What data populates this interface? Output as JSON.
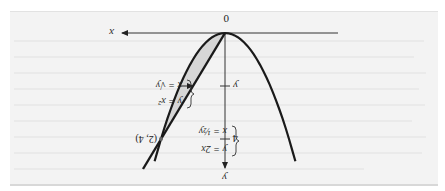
{
  "figure": {
    "orientation": "rotated 180 degrees",
    "axes": {
      "x_label": "x",
      "y_label": "y",
      "origin_label": "0",
      "y_ticks": [
        {
          "label": "y",
          "math_y": 2
        },
        {
          "label": "4",
          "math_y": 4
        }
      ]
    },
    "curves": [
      {
        "name": "parabola",
        "equation": "y = x²",
        "inverse": "x = √y"
      },
      {
        "name": "line",
        "equation": "y = 2x",
        "inverse": "x = ½y"
      }
    ],
    "labels": {
      "parabola_top": "y = x²",
      "parabola_bottom": "x = √y",
      "line_top": "y = 2x",
      "line_bottom": "x = ½y",
      "intersection": "(2, 4)"
    },
    "shaded_region": "between y = 2x and y = x² for 0 ≤ x ≤ 2",
    "strip": "horizontal strip at height y from x = y/2 to x = √y",
    "colors": {
      "background": "#f3f3f3",
      "curve": "#1a1a1a",
      "shade": "#d4d4d4",
      "axis": "#333333"
    }
  }
}
